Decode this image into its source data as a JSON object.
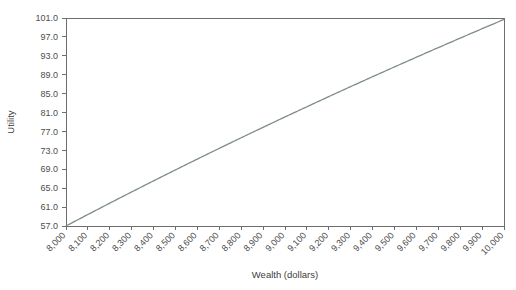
{
  "chart_data": {
    "type": "line",
    "title": "",
    "xlabel": "Wealth (dollars)",
    "ylabel": "Utility",
    "xlim": [
      8000,
      10000
    ],
    "ylim": [
      57.0,
      101.0
    ],
    "grid": false,
    "legend": "none",
    "x_tick_labels": [
      "8,000",
      "8,100",
      "8,200",
      "8,300",
      "8,400",
      "8,500",
      "8,600",
      "8,700",
      "8,800",
      "8,900",
      "9,000",
      "9,100",
      "9,200",
      "9,300",
      "9,400",
      "9,500",
      "9,600",
      "9,700",
      "9,800",
      "9,900",
      "10,000"
    ],
    "y_tick_labels": [
      "101.0",
      "97.0",
      "93.0",
      "89.0",
      "85.0",
      "81.0",
      "77.0",
      "73.0",
      "69.0",
      "65.0",
      "61.0",
      "57.0"
    ],
    "x": [
      8000,
      8100,
      8200,
      8300,
      8400,
      8500,
      8600,
      8700,
      8800,
      8900,
      9000,
      9100,
      9200,
      9300,
      9400,
      9500,
      9600,
      9700,
      9800,
      9900,
      10000
    ],
    "series": [
      {
        "name": "Utility of wealth",
        "color": "#7f8c8d",
        "values": [
          57.0,
          59.4,
          61.7,
          63.9,
          66.1,
          68.2,
          70.3,
          72.3,
          74.3,
          76.2,
          78.1,
          79.9,
          81.7,
          83.5,
          85.2,
          86.9,
          88.5,
          90.2,
          91.8,
          93.3,
          94.9
        ]
      }
    ],
    "curve_note": "concave increasing logarithmic utility curve rising from 57.0 at 8,000 dollars to about 100.7 at 10,000 dollars"
  },
  "axes": {
    "y_axis_title": "Utility",
    "x_axis_title": "Wealth (dollars)"
  },
  "colors": {
    "curve": "#7f8c8d",
    "axis": "#6e6e6e",
    "text": "#4d4d4d",
    "background": "#ffffff"
  }
}
